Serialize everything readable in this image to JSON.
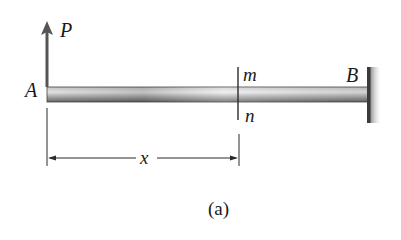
{
  "figure": {
    "labels": {
      "load": "P",
      "free_end": "A",
      "fixed_end": "B",
      "section_top": "m",
      "section_bottom": "n",
      "distance": "x"
    },
    "caption": "(a)",
    "colors": {
      "beam_light": "#e2e2e2",
      "beam_dark": "#5c5c5c",
      "line": "#2a2a2a",
      "wall": "#3a3a3a"
    }
  }
}
